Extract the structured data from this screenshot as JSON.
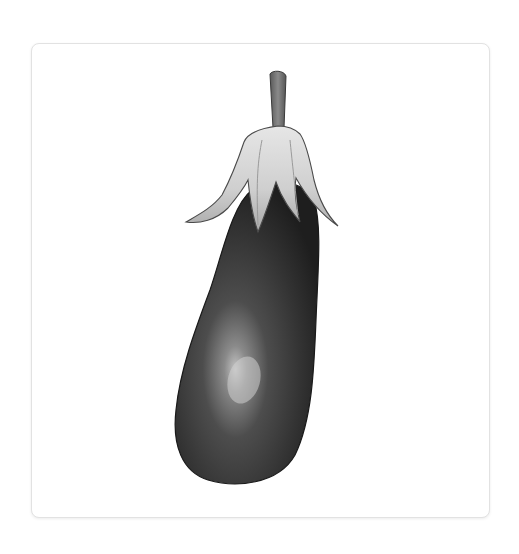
{
  "image": {
    "subject": "eggplant",
    "style": "grayscale watercolor illustration",
    "alt": "Watercolor illustration of an eggplant"
  },
  "colors": {
    "background": "#ffffff",
    "card_border": "#e2e2e2",
    "body_dark": "#2a2a2a",
    "body_mid": "#4a4a4a",
    "highlight": "#bdbdbd",
    "calyx_light": "#d8d8d8",
    "calyx_dark": "#8a8a8a",
    "stem": "#6e6e6e"
  }
}
